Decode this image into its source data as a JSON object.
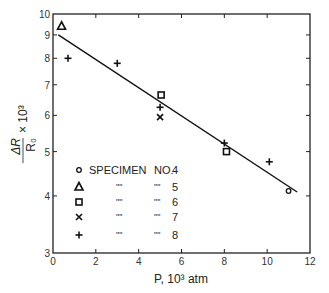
{
  "chart_data": {
    "type": "scatter",
    "title": "",
    "xlabel": "P, 10³ atm",
    "ylabel": "ΔR/R₀ × 10³",
    "xlim": [
      0,
      12
    ],
    "ylim": [
      3,
      10
    ],
    "yscale": "log",
    "grid": false,
    "x_ticks": [
      0,
      2,
      4,
      6,
      8,
      10,
      12
    ],
    "y_ticks": [
      3,
      4,
      5,
      6,
      7,
      8,
      9,
      10
    ],
    "legend_position": "lower-left inside",
    "series": [
      {
        "name": "SPECIMEN NO. 4",
        "marker": "circle",
        "points": [
          [
            11.0,
            4.1
          ]
        ]
      },
      {
        "name": "SPECIMEN NO. 5",
        "marker": "triangle",
        "points": [
          [
            0.4,
            9.4
          ]
        ]
      },
      {
        "name": "SPECIMEN NO. 6",
        "marker": "square",
        "points": [
          [
            5.05,
            6.65
          ],
          [
            8.1,
            5.0
          ]
        ]
      },
      {
        "name": "SPECIMEN NO. 7",
        "marker": "x",
        "points": [
          [
            5.0,
            5.95
          ]
        ]
      },
      {
        "name": "SPECIMEN NO. 8",
        "marker": "plus",
        "points": [
          [
            0.7,
            8.0
          ],
          [
            3.0,
            7.8
          ],
          [
            5.0,
            6.25
          ],
          [
            8.0,
            5.22
          ],
          [
            10.1,
            4.75
          ]
        ]
      }
    ],
    "fit_line": {
      "from": [
        0.25,
        9.0
      ],
      "to": [
        11.4,
        4.08
      ]
    }
  },
  "legend": {
    "header_prefix": "SPECIMEN",
    "header_no": "NO.",
    "ditto": "\"",
    "items": [
      {
        "marker": "circle",
        "num": "4"
      },
      {
        "marker": "triangle",
        "num": "5"
      },
      {
        "marker": "square",
        "num": "6"
      },
      {
        "marker": "x",
        "num": "7"
      },
      {
        "marker": "plus",
        "num": "8"
      }
    ]
  },
  "axes": {
    "x_label": "P, 10³ atm",
    "y_label_num": "ΔR",
    "y_label_den": "R₀",
    "y_label_mult": "× 10³"
  }
}
